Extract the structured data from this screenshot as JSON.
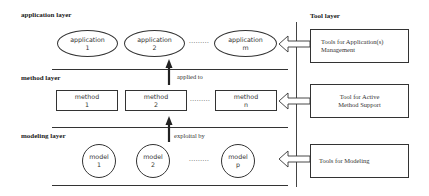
{
  "layers": {
    "application": {
      "title": "application layer"
    },
    "method": {
      "title": "method layer"
    },
    "modeling": {
      "title": "modeling layer"
    },
    "tool": {
      "title": "Tool layer"
    }
  },
  "applications": [
    {
      "name": "application",
      "index": "1"
    },
    {
      "name": "application",
      "index": "2"
    },
    {
      "name": "application",
      "index": "m"
    }
  ],
  "methods": [
    {
      "name": "method",
      "index": "1"
    },
    {
      "name": "method",
      "index": "2"
    },
    {
      "name": "method",
      "index": "n"
    }
  ],
  "models": [
    {
      "name": "model",
      "index": "1"
    },
    {
      "name": "model",
      "index": "2"
    },
    {
      "name": "model",
      "index": "p"
    }
  ],
  "ellipsis": ".........",
  "relations": {
    "applied_to": "applied to",
    "exploited_by": "exploital by"
  },
  "tools": [
    {
      "line1": "Tools for Application(s)",
      "line2": "Management"
    },
    {
      "line1": "Tool for Active",
      "line2": "Method Support"
    },
    {
      "line1": "Tools for Modeling",
      "line2": ""
    }
  ],
  "colors": {
    "stroke": "#333333",
    "background": "#ffffff"
  }
}
